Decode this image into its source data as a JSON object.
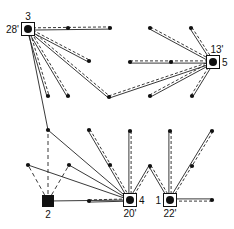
{
  "diagram": {
    "type": "network",
    "hubs": [
      {
        "id": "3",
        "x": 28,
        "y": 29,
        "label": "3",
        "label_pos": "top",
        "time": "28'",
        "time_pos": "left",
        "shape": "square-with-dot"
      },
      {
        "id": "5",
        "x": 213,
        "y": 62,
        "label": "5",
        "label_pos": "right",
        "time": "13'",
        "time_pos": "top",
        "shape": "square-with-dot"
      },
      {
        "id": "4",
        "x": 130,
        "y": 200,
        "label": "4",
        "label_pos": "right",
        "time": "20'",
        "time_pos": "bottom",
        "shape": "square-with-dot"
      },
      {
        "id": "1",
        "x": 170,
        "y": 200,
        "label": "1",
        "label_pos": "left",
        "time": "22'",
        "time_pos": "bottom",
        "shape": "square-with-dot"
      },
      {
        "id": "2",
        "x": 48,
        "y": 201,
        "label": "2",
        "label_pos": "bottom",
        "time": "",
        "shape": "filled-square"
      }
    ],
    "nodes": [
      {
        "x": 68,
        "y": 28
      },
      {
        "x": 110,
        "y": 28
      },
      {
        "x": 89,
        "y": 61
      },
      {
        "x": 48,
        "y": 96
      },
      {
        "x": 68,
        "y": 96
      },
      {
        "x": 109,
        "y": 97
      },
      {
        "x": 150,
        "y": 28
      },
      {
        "x": 191,
        "y": 28
      },
      {
        "x": 130,
        "y": 62
      },
      {
        "x": 171,
        "y": 62
      },
      {
        "x": 150,
        "y": 96
      },
      {
        "x": 192,
        "y": 96
      },
      {
        "x": 48,
        "y": 130
      },
      {
        "x": 28,
        "y": 165
      },
      {
        "x": 69,
        "y": 165
      },
      {
        "x": 89,
        "y": 130
      },
      {
        "x": 110,
        "y": 165
      },
      {
        "x": 89,
        "y": 201
      },
      {
        "x": 130,
        "y": 131
      },
      {
        "x": 170,
        "y": 131
      },
      {
        "x": 212,
        "y": 131
      },
      {
        "x": 150,
        "y": 166
      },
      {
        "x": 192,
        "y": 166
      },
      {
        "x": 212,
        "y": 200
      }
    ],
    "dual_edges": [
      [
        28,
        29,
        110,
        28
      ],
      [
        28,
        29,
        89,
        61
      ],
      [
        28,
        29,
        48,
        96
      ],
      [
        28,
        29,
        68,
        96
      ],
      [
        28,
        29,
        109,
        97
      ],
      [
        109,
        97,
        213,
        62
      ],
      [
        130,
        62,
        213,
        62
      ],
      [
        150,
        28,
        213,
        62
      ],
      [
        191,
        28,
        213,
        62
      ],
      [
        150,
        96,
        213,
        62
      ],
      [
        192,
        96,
        213,
        62
      ],
      [
        89,
        130,
        130,
        200
      ],
      [
        130,
        131,
        130,
        200
      ],
      [
        150,
        166,
        130,
        200
      ],
      [
        89,
        201,
        130,
        200
      ],
      [
        150,
        166,
        170,
        200
      ],
      [
        170,
        131,
        170,
        200
      ],
      [
        212,
        131,
        170,
        200
      ],
      [
        212,
        200,
        170,
        200
      ]
    ],
    "solid_edges": [
      [
        28,
        29,
        48,
        130
      ],
      [
        48,
        130,
        130,
        200
      ],
      [
        28,
        165,
        130,
        200
      ],
      [
        69,
        165,
        130,
        200
      ],
      [
        48,
        201,
        130,
        200
      ]
    ],
    "dashed_edges": [
      [
        48,
        201,
        48,
        130
      ],
      [
        48,
        201,
        28,
        165
      ],
      [
        48,
        201,
        69,
        165
      ]
    ]
  }
}
